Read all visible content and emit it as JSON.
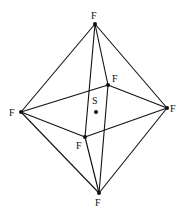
{
  "diagram": {
    "title": "",
    "central_atom": {
      "id": "S",
      "label": "S"
    },
    "ligands": [
      {
        "id": "top",
        "label": "F"
      },
      {
        "id": "left",
        "label": "F"
      },
      {
        "id": "right",
        "label": "F"
      },
      {
        "id": "bottom",
        "label": "F"
      },
      {
        "id": "back",
        "label": "F"
      },
      {
        "id": "front",
        "label": "F"
      }
    ],
    "edges": [
      [
        "top",
        "left"
      ],
      [
        "top",
        "right"
      ],
      [
        "top",
        "back"
      ],
      [
        "top",
        "front"
      ],
      [
        "bottom",
        "left"
      ],
      [
        "bottom",
        "right"
      ],
      [
        "bottom",
        "back"
      ],
      [
        "bottom",
        "front"
      ],
      [
        "left",
        "back"
      ],
      [
        "back",
        "right"
      ],
      [
        "right",
        "front"
      ],
      [
        "front",
        "left"
      ]
    ],
    "shape": "octahedron"
  }
}
